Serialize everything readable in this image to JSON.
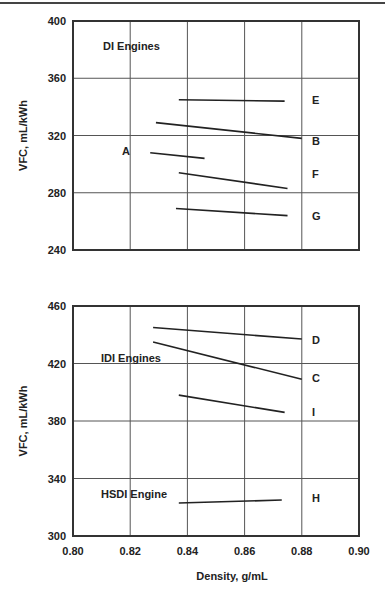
{
  "chart_data": [
    {
      "type": "line",
      "title": "DI Engines",
      "xlabel": "",
      "ylabel": "VFC, mL/kWh",
      "xlim": [
        0.8,
        0.9
      ],
      "ylim": [
        240,
        400
      ],
      "xticks": [
        "0.80",
        "0.82",
        "0.84",
        "0.86",
        "0.88",
        "0.90"
      ],
      "yticks": [
        "240",
        "280",
        "320",
        "360",
        "400"
      ],
      "grid": true,
      "annotation": "DI Engines",
      "series": [
        {
          "name": "E",
          "x": [
            0.837,
            0.874
          ],
          "y": [
            345,
            344
          ]
        },
        {
          "name": "B",
          "x": [
            0.829,
            0.88
          ],
          "y": [
            329,
            318
          ]
        },
        {
          "name": "A",
          "x": [
            0.827,
            0.846
          ],
          "y": [
            308,
            304
          ]
        },
        {
          "name": "F",
          "x": [
            0.837,
            0.875
          ],
          "y": [
            294,
            283
          ]
        },
        {
          "name": "G",
          "x": [
            0.836,
            0.875
          ],
          "y": [
            269,
            264
          ]
        }
      ]
    },
    {
      "type": "line",
      "title": "IDI / HSDI Engines",
      "xlabel": "Density, g/mL",
      "ylabel": "VFC, mL/kWh",
      "xlim": [
        0.8,
        0.9
      ],
      "ylim": [
        300,
        460
      ],
      "xticks": [
        "0.80",
        "0.82",
        "0.84",
        "0.86",
        "0.88",
        "0.90"
      ],
      "yticks": [
        "300",
        "340",
        "380",
        "420",
        "460"
      ],
      "grid": true,
      "annotations": [
        "IDI Engines",
        "HSDI Engine"
      ],
      "series": [
        {
          "name": "D",
          "x": [
            0.828,
            0.88
          ],
          "y": [
            445,
            437
          ]
        },
        {
          "name": "C",
          "x": [
            0.828,
            0.88
          ],
          "y": [
            435,
            409
          ]
        },
        {
          "name": "I",
          "x": [
            0.837,
            0.874
          ],
          "y": [
            398,
            386
          ]
        },
        {
          "name": "H",
          "x": [
            0.837,
            0.873
          ],
          "y": [
            323,
            325
          ]
        }
      ]
    }
  ],
  "labels": {
    "top_group": "DI Engines",
    "idi_group": "IDI Engines",
    "hsdi_group": "HSDI Engine",
    "ylabel": "VFC, mL/kWh",
    "xlabel": "Density, g/mL"
  }
}
